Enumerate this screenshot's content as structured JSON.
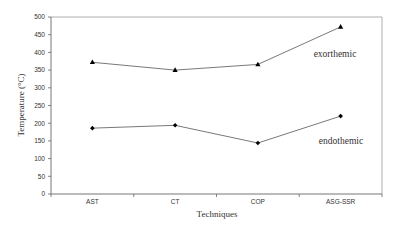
{
  "chart_data": {
    "type": "line",
    "title": "",
    "xlabel": "Techniques",
    "ylabel": "Temperature (°C)",
    "categories": [
      "AST",
      "CT",
      "COP",
      "ASG-SSR"
    ],
    "ylim": [
      0,
      500
    ],
    "yticks": [
      0,
      50,
      100,
      150,
      200,
      250,
      300,
      350,
      400,
      450,
      500
    ],
    "grid": false,
    "legend": "inline labels",
    "series": [
      {
        "name": "exorthemic",
        "marker": "triangle",
        "values": [
          372,
          350,
          366,
          472
        ]
      },
      {
        "name": "endothemic",
        "marker": "diamond",
        "values": [
          186,
          194,
          144,
          220
        ]
      }
    ],
    "colors": {
      "line": "#555555",
      "marker": "#000000",
      "axis": "#666666",
      "frame": "#999999"
    }
  }
}
